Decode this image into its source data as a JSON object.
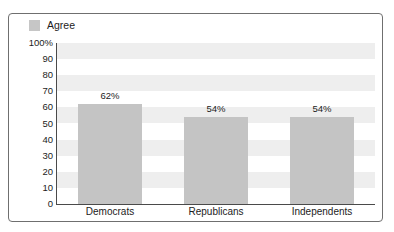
{
  "title_cropped": "PUBLIC RESPONSE TO THE NEW PROPOSAL",
  "legend": {
    "label": "Agree",
    "swatch_color": "#c6c6c6"
  },
  "colors": {
    "bar": "#c4c4c4",
    "band": "#eeeeee",
    "axis": "#4a4a4a",
    "frame_border": "#6f6f6f",
    "text": "#1c1c1c"
  },
  "chart_data": {
    "type": "bar",
    "title": "",
    "xlabel": "",
    "ylabel": "",
    "ylim": [
      0,
      100
    ],
    "yticks": [
      0,
      10,
      20,
      30,
      40,
      50,
      60,
      70,
      80,
      90,
      100
    ],
    "ytick_labels": [
      "0",
      "10",
      "20",
      "30",
      "40",
      "50",
      "60",
      "70",
      "80",
      "90",
      "100%"
    ],
    "categories": [
      "Democrats",
      "Republicans",
      "Independents"
    ],
    "series": [
      {
        "name": "Agree",
        "values": [
          62,
          54,
          54
        ],
        "value_labels": [
          "62%",
          "54%",
          "54%"
        ]
      }
    ],
    "grid": false,
    "alternating_bands": true,
    "band_interval": 10,
    "legend_position": "top-left"
  }
}
